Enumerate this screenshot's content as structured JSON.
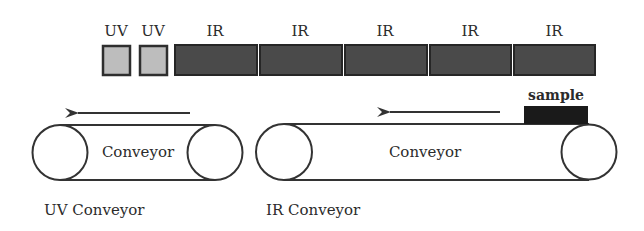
{
  "diagram": {
    "lamps": [
      {
        "type": "UV",
        "label": "UV",
        "x": 103,
        "w": 27
      },
      {
        "type": "UV",
        "label": "UV",
        "x": 140,
        "w": 27
      },
      {
        "type": "IR",
        "label": "IR",
        "x": 174,
        "w": 83
      },
      {
        "type": "IR",
        "label": "IR",
        "x": 259,
        "w": 83
      },
      {
        "type": "IR",
        "label": "IR",
        "x": 344,
        "w": 83
      },
      {
        "type": "IR",
        "label": "IR",
        "x": 429,
        "w": 82
      },
      {
        "type": "IR",
        "label": "IR",
        "x": 513,
        "w": 82
      }
    ],
    "colors": {
      "uv_fill": "#bdbdbd",
      "ir_fill": "#4a4a4a",
      "lamp_border": "#2e2e2e",
      "line": "#333333",
      "sample_fill": "#1a1a1a"
    },
    "uv_conveyor": {
      "belt_label": "Conveyor",
      "caption": "UV Conveyor",
      "direction": "left"
    },
    "ir_conveyor": {
      "belt_label": "Conveyor",
      "caption": "IR Conveyor",
      "direction": "left"
    },
    "sample": {
      "label": "sample"
    }
  }
}
